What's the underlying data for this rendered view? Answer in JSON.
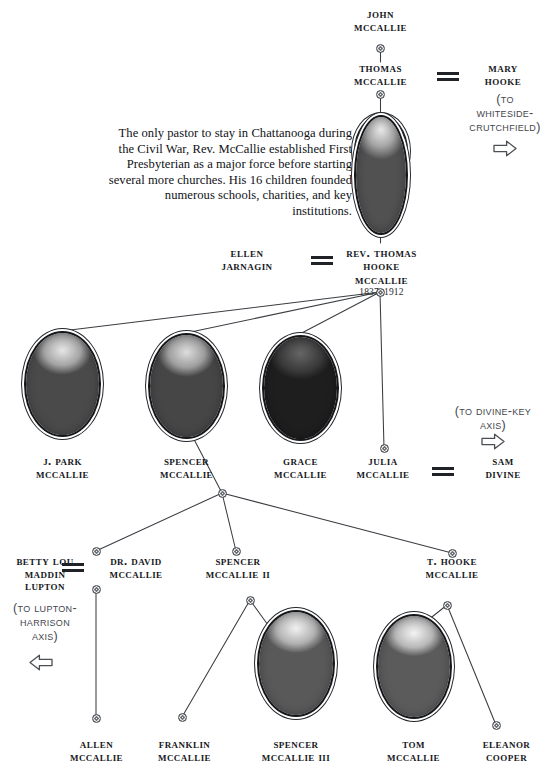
{
  "chart": {
    "blurb": "The only pastor to stay in Chattanooga during the Civil War, Rev. McCallie established First Presbyterian as a major force before starting several more churches. His 16 children founded numerous schools, charities, and key institutions.",
    "colors": {
      "ink": "#16181c",
      "line": "#3a3d42",
      "note": "#44474d",
      "background": "#ffffff"
    },
    "people": [
      {
        "id": "john",
        "name": "John\nMcCallie"
      },
      {
        "id": "thomas",
        "name": "Thomas\nMcCallie"
      },
      {
        "id": "mary",
        "name": "Mary\nHooke"
      },
      {
        "id": "ellen",
        "name": "Ellen\nJarnagin"
      },
      {
        "id": "rev_thomas",
        "name": "Rev. Thomas\nHooke\nMcCallie",
        "years": "1837–1912"
      },
      {
        "id": "jpark",
        "name": "J. Park\nMcCallie"
      },
      {
        "id": "spencer",
        "name": "Spencer\nMcCallie"
      },
      {
        "id": "grace",
        "name": "Grace\nMcCallie"
      },
      {
        "id": "julia",
        "name": "Julia\nMcCallie"
      },
      {
        "id": "sam",
        "name": "Sam\nDivine"
      },
      {
        "id": "betty",
        "name": "Betty Lou\nMaddin\nLupton"
      },
      {
        "id": "david",
        "name": "Dr. David\nMcCallie"
      },
      {
        "id": "spencer2",
        "name": "Spencer\nMcCallie  II"
      },
      {
        "id": "thooke",
        "name": "T. Hooke\nMcCallie"
      },
      {
        "id": "allen",
        "name": "Allen\nMcCallie"
      },
      {
        "id": "franklin",
        "name": "Franklin\nMcCallie"
      },
      {
        "id": "spencer3",
        "name": "Spencer\nMcCallie III"
      },
      {
        "id": "tom",
        "name": "Tom\nMcCallie"
      },
      {
        "id": "eleanor",
        "name": "Eleanor\nCooper"
      }
    ],
    "notes": [
      {
        "id": "whiteside",
        "text": "(To\nWhiteside-\nCrutchfield)",
        "arrow": "right-arrow"
      },
      {
        "id": "divine",
        "text": "(To Divine-Key\nAxis)",
        "arrow": "right-arrow"
      },
      {
        "id": "lupton",
        "text": "(To Lupton-\nHarrison\nAxis)",
        "arrow": "left-arrow"
      }
    ],
    "marriages": [
      {
        "id": "thomas-mary",
        "left": "thomas",
        "right": "mary",
        "symbol": "="
      },
      {
        "id": "ellen-rev",
        "left": "ellen",
        "right": "rev_thomas",
        "symbol": "="
      },
      {
        "id": "julia-sam",
        "left": "julia",
        "right": "sam",
        "symbol": "="
      },
      {
        "id": "betty-david",
        "left": "betty",
        "right": "david",
        "symbol": "="
      }
    ],
    "portraits": [
      {
        "id": "rev_thomas",
        "person": "rev_thomas",
        "subject": "bearded-elder-man"
      },
      {
        "id": "jpark",
        "person": "jpark",
        "subject": "bald-man-suit"
      },
      {
        "id": "spencer",
        "person": "spencer",
        "subject": "mustached-man-bowtie"
      },
      {
        "id": "grace",
        "person": "grace",
        "subject": "woman-updo-hair"
      },
      {
        "id": "spencer3",
        "person": "spencer3",
        "subject": "man-glasses-books"
      },
      {
        "id": "tom",
        "person": "tom",
        "subject": "smiling-white-haired-man"
      }
    ]
  }
}
